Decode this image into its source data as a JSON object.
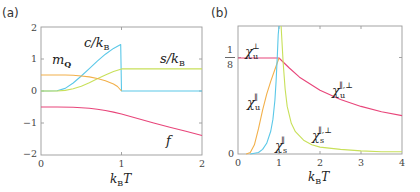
{
  "chart_data": [
    {
      "panel": "(a)",
      "type": "line",
      "xlabel": "k_B T",
      "ylabel": "",
      "xlim": [
        0,
        2
      ],
      "ylim": [
        -2,
        2
      ],
      "xticks": [
        "0",
        "1",
        "2"
      ],
      "yticks": [
        "-2",
        "-1",
        "0",
        "1",
        "2"
      ],
      "grid": false,
      "legend": "inline curve labels",
      "series": [
        {
          "name": "c/k_B",
          "label": "c/k",
          "label_sub": "B",
          "color": "#5bc8e8",
          "x": [
            0,
            0.1,
            0.2,
            0.3,
            0.4,
            0.5,
            0.6,
            0.7,
            0.8,
            0.9,
            0.99,
            1.0,
            1.2,
            1.4,
            1.6,
            1.8,
            2.0
          ],
          "y": [
            0,
            0,
            0.01,
            0.08,
            0.25,
            0.47,
            0.7,
            0.93,
            1.15,
            1.33,
            1.45,
            0,
            0,
            0,
            0,
            0,
            0
          ]
        },
        {
          "name": "s/k_B",
          "label": "s/k",
          "label_sub": "B",
          "color": "#c8e05a",
          "x": [
            0,
            0.1,
            0.2,
            0.3,
            0.4,
            0.5,
            0.6,
            0.7,
            0.8,
            0.9,
            1.0,
            1.2,
            1.4,
            1.6,
            1.8,
            2.0
          ],
          "y": [
            0,
            0,
            0.0,
            0.02,
            0.07,
            0.15,
            0.26,
            0.38,
            0.5,
            0.61,
            0.69,
            0.69,
            0.69,
            0.69,
            0.69,
            0.69
          ]
        },
        {
          "name": "m_Q",
          "label": "m",
          "label_sub": "Q",
          "color": "#f2b04a",
          "x": [
            0,
            0.1,
            0.2,
            0.3,
            0.4,
            0.5,
            0.6,
            0.7,
            0.8,
            0.9,
            0.95,
            1.0
          ],
          "y": [
            0.5,
            0.5,
            0.5,
            0.5,
            0.49,
            0.47,
            0.44,
            0.39,
            0.32,
            0.22,
            0.14,
            0
          ]
        },
        {
          "name": "f",
          "label": "f",
          "label_sub": "",
          "color": "#e8457a",
          "x": [
            0,
            0.2,
            0.4,
            0.6,
            0.7,
            0.8,
            0.9,
            1.0,
            1.2,
            1.4,
            1.6,
            1.8,
            2.0
          ],
          "y": [
            -0.5,
            -0.5,
            -0.51,
            -0.54,
            -0.57,
            -0.61,
            -0.66,
            -0.72,
            -0.86,
            -1.0,
            -1.13,
            -1.26,
            -1.39
          ]
        }
      ]
    },
    {
      "panel": "(b)",
      "type": "line",
      "xlabel": "k_B T",
      "ylabel": "",
      "xlim": [
        0,
        4
      ],
      "ylim": [
        0,
        0.1667
      ],
      "xticks": [
        "0",
        "1",
        "2",
        "3",
        "4"
      ],
      "yticks": [
        "0",
        "1/8"
      ],
      "grid": false,
      "legend": "inline curve labels",
      "series": [
        {
          "name": "chi_u^perp / chi_u^{||,perp}",
          "label": "χ",
          "label_sub": "u",
          "label_sup": "⊥",
          "color": "#e8457a",
          "x": [
            0,
            0.5,
            0.95,
            1.0,
            1.25,
            1.5,
            2.0,
            2.5,
            3.0,
            3.5,
            4.0
          ],
          "y": [
            0.125,
            0.125,
            0.125,
            0.125,
            0.112,
            0.1,
            0.083,
            0.071,
            0.062,
            0.055,
            0.05
          ]
        },
        {
          "name": "chi_u^{||}",
          "label": "χ",
          "label_sub": "u",
          "label_sup": "∥",
          "color": "#f2b04a",
          "x": [
            0.2,
            0.3,
            0.4,
            0.5,
            0.6,
            0.7,
            0.8,
            0.9,
            1.0
          ],
          "y": [
            0.0,
            0.002,
            0.012,
            0.033,
            0.057,
            0.078,
            0.095,
            0.11,
            0.125
          ]
        },
        {
          "name": "chi_s^{||}",
          "label": "χ",
          "label_sub": "s",
          "label_sup": "∥",
          "color": "#5bc8e8",
          "x": [
            0.3,
            0.5,
            0.6,
            0.7,
            0.8,
            0.85,
            0.9,
            0.93,
            0.96,
            0.98,
            1.0
          ],
          "y": [
            0.0,
            0.002,
            0.006,
            0.014,
            0.03,
            0.045,
            0.07,
            0.095,
            0.13,
            0.155,
            0.1667
          ]
        },
        {
          "name": "chi_s^{||,perp}",
          "label": "χ",
          "label_sub": "s",
          "label_sup": "∥,⊥",
          "color": "#c8e05a",
          "x": [
            1.05,
            1.1,
            1.15,
            1.2,
            1.3,
            1.4,
            1.6,
            1.8,
            2.0,
            2.5,
            3.0,
            3.5,
            4.0
          ],
          "y": [
            0.1667,
            0.12,
            0.085,
            0.062,
            0.04,
            0.029,
            0.018,
            0.012,
            0.009,
            0.006,
            0.004,
            0.003,
            0.003
          ]
        }
      ]
    }
  ],
  "panels": {
    "a": {
      "label": "(a)",
      "xlabel_k": "k",
      "xlabel_sub": "B",
      "xlabel_T": "T",
      "curve_labels": {
        "c": "c/k",
        "c_sub": "B",
        "s": "s/k",
        "s_sub": "B",
        "m": "m",
        "m_sub": "Q",
        "f": "f"
      },
      "ticks": {
        "x0": "0",
        "x1": "1",
        "x2": "2",
        "ym2": "−2",
        "ym1": "−1",
        "y0": "0",
        "y1": "1",
        "y2": "2"
      }
    },
    "b": {
      "label": "(b)",
      "xlabel_k": "k",
      "xlabel_sub": "B",
      "xlabel_T": "T",
      "curve_labels": {
        "chi": "χ",
        "u_perp_sub": "u",
        "u_perp_sup": "⊥",
        "u_par_sub": "u",
        "u_par_sup": "∥",
        "s_par_sub": "s",
        "s_par_sup": "∥",
        "u_both_sub": "u",
        "u_both_sup": "∥,⊥",
        "s_both_sub": "s",
        "s_both_sup": "∥,⊥"
      },
      "ticks": {
        "x0": "0",
        "x1": "1",
        "x2": "2",
        "x3": "3",
        "x4": "4",
        "y0": "0",
        "y_num": "1",
        "y_den": "8"
      }
    }
  }
}
